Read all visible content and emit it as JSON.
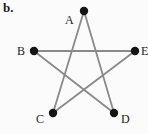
{
  "figure": {
    "panel_label": "b.",
    "type": "pentagram-graph",
    "width": 148,
    "height": 134,
    "background_color": "#fbfbfb",
    "edge_color": "#8a8a8a",
    "edge_width": 1.8,
    "vertex_color": "#141414",
    "vertex_radius": 4.2,
    "label_color": "#1b1b1b",
    "vertices": [
      {
        "id": "A",
        "label": "A",
        "x": 84,
        "y": 11,
        "label_x": 65,
        "label_y": 14
      },
      {
        "id": "B",
        "label": "B",
        "x": 34,
        "y": 51,
        "label_x": 17,
        "label_y": 45
      },
      {
        "id": "E",
        "label": "E",
        "x": 135,
        "y": 51,
        "label_x": 141,
        "label_y": 45
      },
      {
        "id": "C",
        "label": "C",
        "x": 53,
        "y": 113,
        "label_x": 36,
        "label_y": 113
      },
      {
        "id": "D",
        "label": "D",
        "x": 114,
        "y": 113,
        "label_x": 121,
        "label_y": 113
      }
    ],
    "edges": [
      {
        "from": "A",
        "to": "C"
      },
      {
        "from": "A",
        "to": "D"
      },
      {
        "from": "B",
        "to": "E"
      },
      {
        "from": "B",
        "to": "D"
      },
      {
        "from": "C",
        "to": "E"
      }
    ]
  }
}
